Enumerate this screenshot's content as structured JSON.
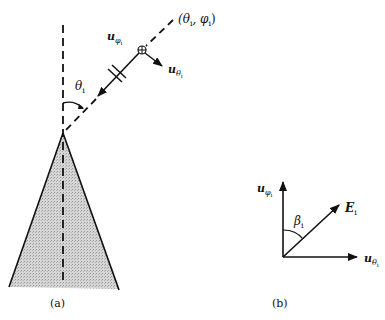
{
  "figure": {
    "panel_a": {
      "label": "(a)",
      "direction_label": "(θ",
      "direction_label_sub1": "i",
      "direction_label_mid": ", φ",
      "direction_label_sub2": "i",
      "direction_label_end": ")",
      "u_phi_label": "u",
      "u_phi_sub": "φ",
      "u_phi_subsub": "i",
      "u_theta_label": "u",
      "u_theta_sub": "θ",
      "u_theta_subsub": "i",
      "angle_label": "θ",
      "angle_sub": "i"
    },
    "panel_b": {
      "label": "(b)",
      "u_phi_label": "u",
      "u_phi_sub": "φ",
      "u_phi_subsub": "i",
      "u_theta_label": "u",
      "u_theta_sub": "θ",
      "u_theta_subsub": "i",
      "e_label": "E",
      "e_sub": "i",
      "angle_label": "β",
      "angle_sub": "i"
    },
    "colors": {
      "line": "#111111",
      "cone_fill": "#c8c8c8"
    }
  }
}
